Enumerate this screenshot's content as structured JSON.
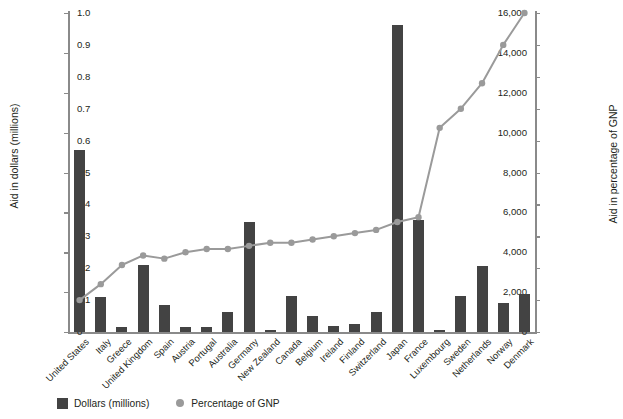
{
  "chart_data": {
    "type": "bar",
    "title": "",
    "subtitle": "",
    "xlabel": "",
    "ylabel": "Aid in dollars (millions)",
    "y2label": "Aid in percentage of GNP",
    "grid": false,
    "legend_position": "bottom-left",
    "ylim": [
      0,
      16000
    ],
    "y2lim": [
      0,
      1.0
    ],
    "yticks": [
      0,
      2000,
      4000,
      6000,
      8000,
      10000,
      12000,
      14000,
      16000
    ],
    "ytick_labels": [
      "0",
      "2,000",
      "4,000",
      "6,000",
      "8,000",
      "10,000",
      "12,000",
      "14,000",
      "16,000"
    ],
    "y2ticks": [
      0,
      0.1,
      0.2,
      0.3,
      0.4,
      0.5,
      0.6,
      0.7,
      0.8,
      0.9,
      1.0
    ],
    "y2tick_labels": [
      "0",
      "0.1",
      "0.2",
      "0.3",
      "0.4",
      "0.5",
      "0.6",
      "0.7",
      "0.8",
      "0.9",
      "1.0"
    ],
    "categories": [
      "United States",
      "Italy",
      "Greece",
      "United Kingdom",
      "Spain",
      "Austria",
      "Portugal",
      "Australia",
      "Germany",
      "New Zealand",
      "Canada",
      "Belgium",
      "Ireland",
      "Finland",
      "Switzerland",
      "Japan",
      "France",
      "Luxembourg",
      "Sweden",
      "Netherlands",
      "Norway",
      "Denmark"
    ],
    "series": [
      {
        "name": "Dollars (millions)",
        "type": "bar",
        "axis": "left",
        "color": "#434343",
        "values": [
          9150,
          1750,
          230,
          3350,
          1350,
          270,
          250,
          1000,
          5500,
          110,
          1820,
          800,
          280,
          400,
          1010,
          15400,
          5600,
          120,
          1790,
          3300,
          1480,
          1900
        ]
      },
      {
        "name": "Percentage of GNP",
        "type": "line",
        "axis": "right",
        "color": "#9a9a9a",
        "values": [
          0.1,
          0.15,
          0.21,
          0.24,
          0.23,
          0.25,
          0.26,
          0.26,
          0.27,
          0.28,
          0.28,
          0.29,
          0.3,
          0.31,
          0.32,
          0.345,
          0.36,
          0.64,
          0.7,
          0.78,
          0.9,
          1.0
        ]
      }
    ]
  },
  "legend": {
    "items": [
      {
        "label": "Dollars (millions)",
        "marker": "square-swatch-icon",
        "color": "#434343"
      },
      {
        "label": "Percentage of GNP",
        "marker": "circle-dot-icon",
        "color": "#9a9a9a"
      }
    ]
  },
  "axes": {
    "left_title": "Aid in dollars (millions)",
    "right_title": "Aid in percentage of GNP"
  }
}
